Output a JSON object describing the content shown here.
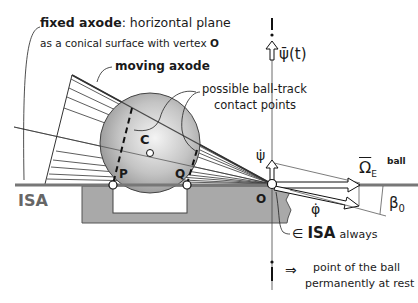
{
  "labels": {
    "fixed_axode_bold": "fixed axode",
    "fixed_axode_rest": ": horizontal plane",
    "fixed_axode_line2": "as a conical surface  with vertex",
    "vertex_name": "O",
    "moving_axode": "moving axode",
    "contact_line1": "possible ball-track",
    "contact_line2": "contact points",
    "psi_bar_t": "ψ̄(t)",
    "psi_dot": "ψ̇",
    "phi_dot": "φ̇",
    "omega": "Ω",
    "omega_sub": "E",
    "omega_sup": "ball",
    "beta": "β",
    "beta_sub": "0",
    "isa_left": "ISA",
    "point_C": "C",
    "point_P": "P",
    "point_Q": "Q",
    "point_O": "O",
    "in_symbol": "∈",
    "isa_always_isa": "ISA",
    "isa_always_word": "always",
    "implies": "⇒",
    "rest_line1": "point of the ball",
    "rest_line2": "permanently at rest",
    "axis_top_mark": "i",
    "axis_bottom_mark": "i"
  },
  "colors": {
    "rail": "#777777",
    "block": "#a9a9a9",
    "ball_light": "#f2f2f2",
    "ball_dark": "#8c8c8c",
    "ink": "#1a1a1a",
    "isa_text": "#666666"
  }
}
